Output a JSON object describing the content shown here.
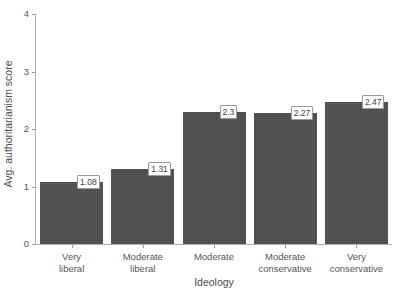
{
  "chart_data": {
    "type": "bar",
    "title": "",
    "subtitle": "",
    "xlabel": "Ideology",
    "ylabel": "Avg. authoritarianism score",
    "categories": [
      "Very liberal",
      "Moderate liberal",
      "Moderate",
      "Moderate conservative",
      "Very conservative"
    ],
    "category_lines": [
      [
        "Very",
        "liberal"
      ],
      [
        "Moderate",
        "liberal"
      ],
      [
        "Moderate",
        ""
      ],
      [
        "Moderate",
        "conservative"
      ],
      [
        "Very",
        "conservative"
      ]
    ],
    "values": [
      1.08,
      1.31,
      2.3,
      2.27,
      2.47
    ],
    "value_labels": [
      "1.08",
      "1.31",
      "2.3",
      "2.27",
      "2.47"
    ],
    "ylim": [
      0,
      4
    ],
    "yticks": [
      0,
      1,
      2,
      3,
      4
    ],
    "ytick_labels": [
      "0",
      "1",
      "2",
      "3",
      "4"
    ],
    "grid": false,
    "legend": null,
    "bar_color": "#4d4d4d",
    "label_box_fill": "#ffffff",
    "label_box_border": "#9a9a9a",
    "axis_color": "#b0b0b0",
    "text_color": "#4d4d4d"
  }
}
